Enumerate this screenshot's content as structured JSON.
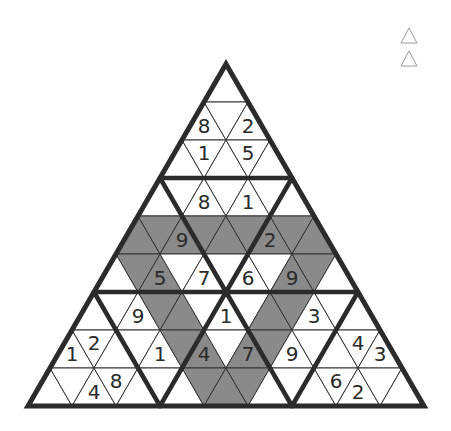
{
  "puzzle": {
    "type": "triangular-sudoku",
    "rows": 9,
    "geometry": {
      "apex_x": 226,
      "apex_y": 64,
      "row_height": 38,
      "half_width": 22
    },
    "colors": {
      "shaded": "#8a8a8a",
      "plain": "#ffffff",
      "line": "#333333",
      "digit": "#2a2a2a"
    },
    "shaded_cells": {
      "4": [
        0,
        1,
        2,
        3,
        4,
        5,
        6,
        7,
        8
      ],
      "5": [
        1,
        2,
        8,
        9
      ],
      "6": [
        3,
        4,
        8,
        9
      ],
      "7": [
        5,
        6,
        8,
        9
      ],
      "8": [
        7,
        8,
        9
      ]
    },
    "givens": [
      {
        "row": 1,
        "col": 0,
        "value": "8"
      },
      {
        "row": 1,
        "col": 2,
        "value": "2"
      },
      {
        "row": 2,
        "col": 1,
        "value": "1"
      },
      {
        "row": 2,
        "col": 3,
        "value": "5"
      },
      {
        "row": 3,
        "col": 2,
        "value": "8"
      },
      {
        "row": 3,
        "col": 4,
        "value": "1"
      },
      {
        "row": 4,
        "col": 2,
        "value": "9"
      },
      {
        "row": 4,
        "col": 6,
        "value": "2"
      },
      {
        "row": 5,
        "col": 2,
        "value": "5"
      },
      {
        "row": 5,
        "col": 4,
        "value": "7"
      },
      {
        "row": 5,
        "col": 6,
        "value": "6"
      },
      {
        "row": 5,
        "col": 8,
        "value": "9"
      },
      {
        "row": 6,
        "col": 2,
        "value": "9"
      },
      {
        "row": 6,
        "col": 6,
        "value": "1"
      },
      {
        "row": 6,
        "col": 10,
        "value": "3"
      },
      {
        "row": 7,
        "col": 0,
        "value": "1"
      },
      {
        "row": 7,
        "col": 1,
        "value": "2"
      },
      {
        "row": 7,
        "col": 4,
        "value": "1"
      },
      {
        "row": 7,
        "col": 6,
        "value": "4"
      },
      {
        "row": 7,
        "col": 8,
        "value": "7"
      },
      {
        "row": 7,
        "col": 10,
        "value": "9"
      },
      {
        "row": 7,
        "col": 13,
        "value": "4"
      },
      {
        "row": 7,
        "col": 14,
        "value": "3"
      },
      {
        "row": 8,
        "col": 2,
        "value": "4"
      },
      {
        "row": 8,
        "col": 3,
        "value": "8"
      },
      {
        "row": 8,
        "col": 13,
        "value": "6"
      },
      {
        "row": 8,
        "col": 14,
        "value": "2"
      }
    ],
    "thick_lines": [
      [
        160,
        178,
        292,
        178
      ],
      [
        94,
        292,
        358,
        292
      ],
      [
        160,
        178,
        226,
        292
      ],
      [
        292,
        178,
        226,
        292
      ],
      [
        94,
        292,
        160,
        406
      ],
      [
        226,
        292,
        160,
        406
      ],
      [
        226,
        292,
        292,
        406
      ],
      [
        358,
        292,
        292,
        406
      ]
    ]
  },
  "toolbar": {
    "icons": [
      {
        "name": "triangle-outline-icon-1"
      },
      {
        "name": "triangle-outline-icon-2"
      }
    ]
  }
}
